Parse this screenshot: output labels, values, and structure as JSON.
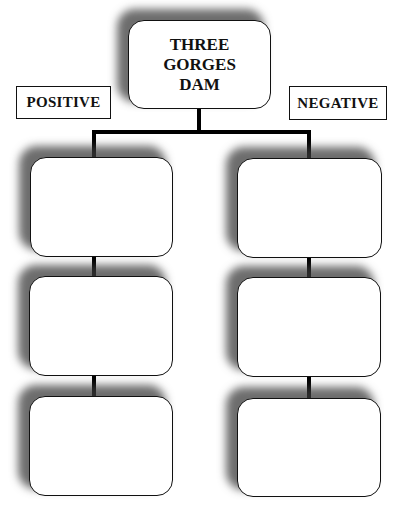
{
  "diagram": {
    "title_lines": [
      "THREE",
      "GORGES",
      "DAM"
    ],
    "labels": {
      "positive": "POSITIVE",
      "negative": "NEGATIVE"
    },
    "columns": [
      {
        "name": "positive",
        "boxes": [
          "",
          "",
          ""
        ]
      },
      {
        "name": "negative",
        "boxes": [
          "",
          "",
          ""
        ]
      }
    ],
    "colors": {
      "border": "#111111",
      "connector": "#000000",
      "shadow": "#3c3c3c",
      "background": "#ffffff"
    }
  }
}
